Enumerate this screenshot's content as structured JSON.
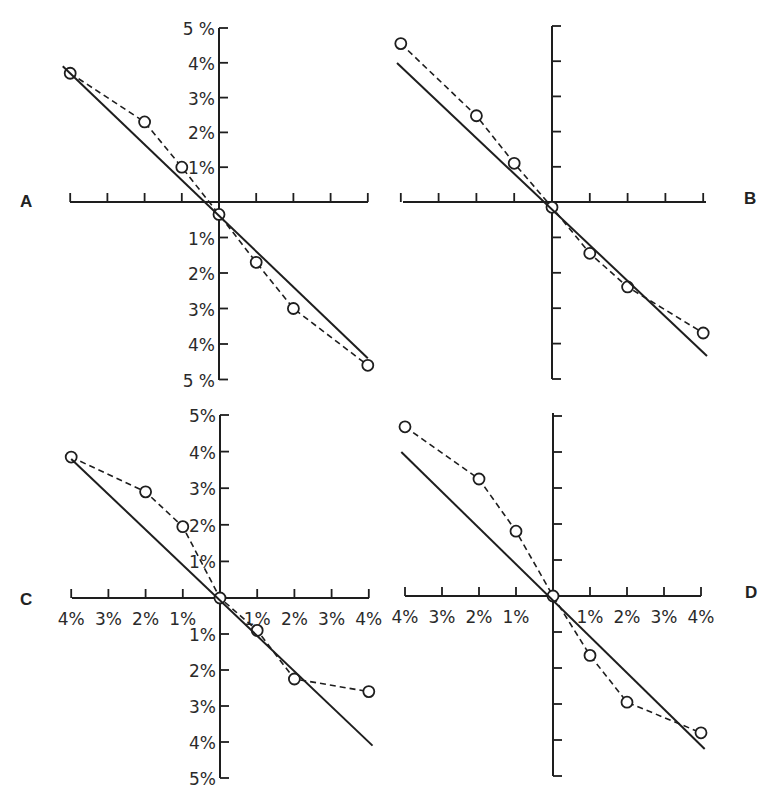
{
  "figure": {
    "background": "#ffffff",
    "ink_color": "#1e1e1e",
    "panel_letters": [
      "A",
      "B",
      "C",
      "D"
    ]
  },
  "chart_data": [
    {
      "panel": "A",
      "type": "line",
      "title": "",
      "xlabel": "",
      "ylabel": "",
      "x_tick_labels": [],
      "y_tick_labels": [
        "5 %",
        "4%",
        "3%",
        "2%",
        "1%",
        "1%",
        "2%",
        "3%",
        "4%",
        "5 %"
      ],
      "xlim": [
        -4,
        4
      ],
      "ylim": [
        -5,
        5
      ],
      "grid": false,
      "series": [
        {
          "name": "observed",
          "style": "dashed-with-open-circles",
          "x": [
            -4,
            -2,
            -1,
            0,
            1,
            2,
            4
          ],
          "y": [
            3.7,
            2.3,
            1.0,
            -0.35,
            -1.7,
            -3.0,
            -4.6
          ]
        },
        {
          "name": "fitted",
          "style": "solid",
          "x": [
            -4.2,
            4.0
          ],
          "y": [
            3.9,
            -4.4
          ]
        }
      ]
    },
    {
      "panel": "B",
      "type": "line",
      "title": "",
      "xlabel": "",
      "ylabel": "",
      "x_tick_labels": [],
      "y_tick_labels": [],
      "xlim": [
        -4,
        4
      ],
      "ylim": [
        -5,
        5
      ],
      "grid": false,
      "series": [
        {
          "name": "observed",
          "style": "dashed-with-open-circles",
          "x": [
            -4,
            -2,
            -1,
            0,
            1,
            2,
            4
          ],
          "y": [
            4.5,
            2.45,
            1.1,
            -0.15,
            -1.45,
            -2.4,
            -3.7
          ]
        },
        {
          "name": "fitted",
          "style": "solid",
          "x": [
            -4.1,
            4.1
          ],
          "y": [
            3.95,
            -4.35
          ]
        }
      ]
    },
    {
      "panel": "C",
      "type": "line",
      "title": "",
      "xlabel": "",
      "ylabel": "",
      "x_tick_labels": [
        "4%",
        "3%",
        "2%",
        "1%",
        "",
        "1%",
        "2%",
        "3%",
        "4%"
      ],
      "y_tick_labels": [
        "5%",
        "4%",
        "3%",
        "2%",
        "1%",
        "1%",
        "2%",
        "3%",
        "4%",
        "5%"
      ],
      "xlim": [
        -4,
        4
      ],
      "ylim": [
        -5,
        5
      ],
      "grid": false,
      "series": [
        {
          "name": "observed",
          "style": "dashed-with-open-circles",
          "x": [
            -4,
            -2,
            -1,
            0,
            1,
            2,
            4
          ],
          "y": [
            3.85,
            2.9,
            1.95,
            0,
            -0.9,
            -2.25,
            -2.6
          ]
        },
        {
          "name": "fitted",
          "style": "solid",
          "x": [
            -4.0,
            4.1
          ],
          "y": [
            3.8,
            -4.1
          ]
        }
      ]
    },
    {
      "panel": "D",
      "type": "line",
      "title": "",
      "xlabel": "",
      "ylabel": "",
      "x_tick_labels": [
        "4%",
        "3%",
        "2%",
        "1%",
        "",
        "1%",
        "2%",
        "3%",
        "4%"
      ],
      "y_tick_labels": [],
      "xlim": [
        -4,
        4
      ],
      "ylim": [
        -5,
        5
      ],
      "grid": false,
      "series": [
        {
          "name": "observed",
          "style": "dashed-with-open-circles",
          "x": [
            -4,
            -2,
            -1,
            0,
            1,
            2,
            4
          ],
          "y": [
            4.7,
            3.25,
            1.8,
            0,
            -1.65,
            -2.95,
            -3.8
          ]
        },
        {
          "name": "fitted",
          "style": "solid",
          "x": [
            -4.1,
            4.1
          ],
          "y": [
            4.0,
            -4.25
          ]
        }
      ]
    }
  ]
}
